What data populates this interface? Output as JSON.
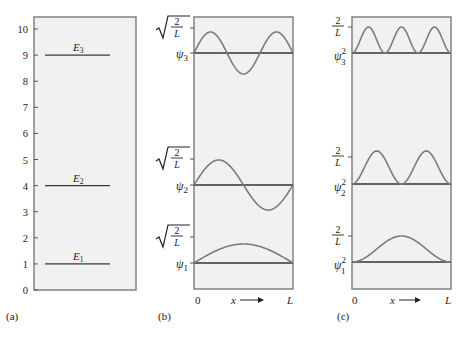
{
  "panels": {
    "a": {
      "caption": "(a)",
      "axis_ticks": [
        "0",
        "1",
        "2",
        "3",
        "4",
        "5",
        "6",
        "7",
        "8",
        "9",
        "10"
      ],
      "levels": [
        {
          "label": "E",
          "sub": "1",
          "value": 1
        },
        {
          "label": "E",
          "sub": "2",
          "value": 4
        },
        {
          "label": "E",
          "sub": "3",
          "value": 9
        }
      ]
    },
    "b": {
      "caption": "(b)",
      "amplitude_label": "√(2/L)",
      "amp_num": "2",
      "amp_den": "L",
      "functions": [
        {
          "label": "ψ",
          "sub": "1",
          "n": 1
        },
        {
          "label": "ψ",
          "sub": "2",
          "n": 2
        },
        {
          "label": "ψ",
          "sub": "3",
          "n": 3
        }
      ],
      "x_start": "0",
      "x_end": "L",
      "x_axis": "x",
      "arrow": "⟶"
    },
    "c": {
      "caption": "(c)",
      "amplitude_label": "2/L",
      "amp_num": "2",
      "amp_den": "L",
      "functions": [
        {
          "label": "ψ",
          "sub": "1",
          "sup": "2",
          "n": 1
        },
        {
          "label": "ψ",
          "sub": "2",
          "sup": "2",
          "n": 2
        },
        {
          "label": "ψ",
          "sub": "3",
          "sup": "2",
          "n": 3
        }
      ],
      "x_start": "0",
      "x_end": "L",
      "x_axis": "x",
      "arrow": "⟶"
    }
  },
  "chart_data": {
    "type": "diagram",
    "energy_levels": {
      "ylim": [
        0,
        10
      ],
      "E1": 1,
      "E2": 4,
      "E3": 9
    },
    "wavefunctions": {
      "formula": "psi_n(x) = sqrt(2/L) sin(n*pi*x/L)",
      "n": [
        1,
        2,
        3
      ]
    },
    "probability_densities": {
      "formula": "psi_n^2(x) = (2/L) sin^2(n*pi*x/L)",
      "n": [
        1,
        2,
        3
      ]
    }
  }
}
